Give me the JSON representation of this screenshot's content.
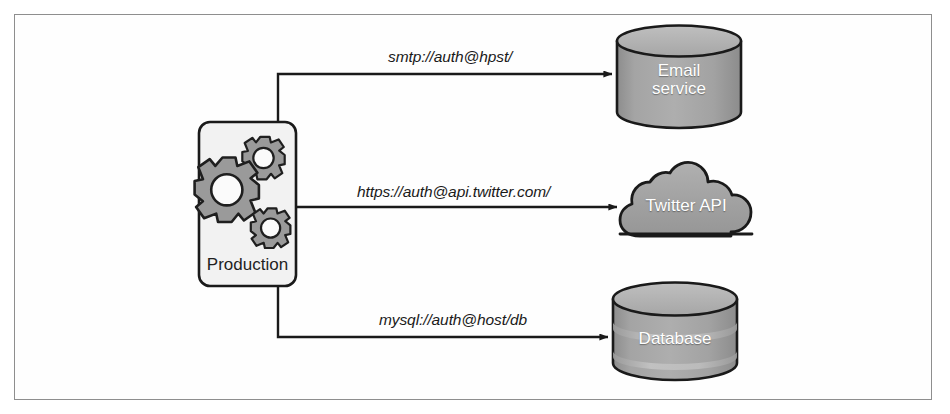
{
  "figure": {
    "kind": "architecture-diagram",
    "border_color": "#8e8e8e",
    "background": "#fefefe"
  },
  "palette": {
    "shape_fill": "#a0a0a0",
    "shape_fill_light": "#b5b5b5",
    "shape_fill_dark": "#8f8f8f",
    "shape_stroke": "#1a1a1a",
    "gear_fill": "#9a9a9a",
    "box_fill": "#f2f2f2",
    "box_stroke": "#1a1a1a",
    "line_color": "#1a1a1a",
    "label_color": "#1a1a1a",
    "node_text_color": "#ffffff"
  },
  "source_node": {
    "id": "production",
    "label": "Production",
    "icon": "gears-icon"
  },
  "target_nodes": [
    {
      "id": "email-service",
      "label": "Email\nservice",
      "label_line1": "Email",
      "label_line2": "service",
      "shape": "cylinder"
    },
    {
      "id": "twitter-api",
      "label": "Twitter API",
      "label_line1": "Twitter API",
      "label_line2": "",
      "shape": "cloud"
    },
    {
      "id": "database",
      "label": "Database",
      "label_line1": "Database",
      "label_line2": "",
      "shape": "cylinder-banded"
    }
  ],
  "connections": [
    {
      "id": "edge-smtp",
      "from": "production",
      "to": "email-service",
      "label": "smtp://auth@hpst/"
    },
    {
      "id": "edge-https",
      "from": "production",
      "to": "twitter-api",
      "label": "https://auth@api.twitter.com/"
    },
    {
      "id": "edge-mysql",
      "from": "production",
      "to": "database",
      "label": "mysql://auth@host/db"
    }
  ]
}
